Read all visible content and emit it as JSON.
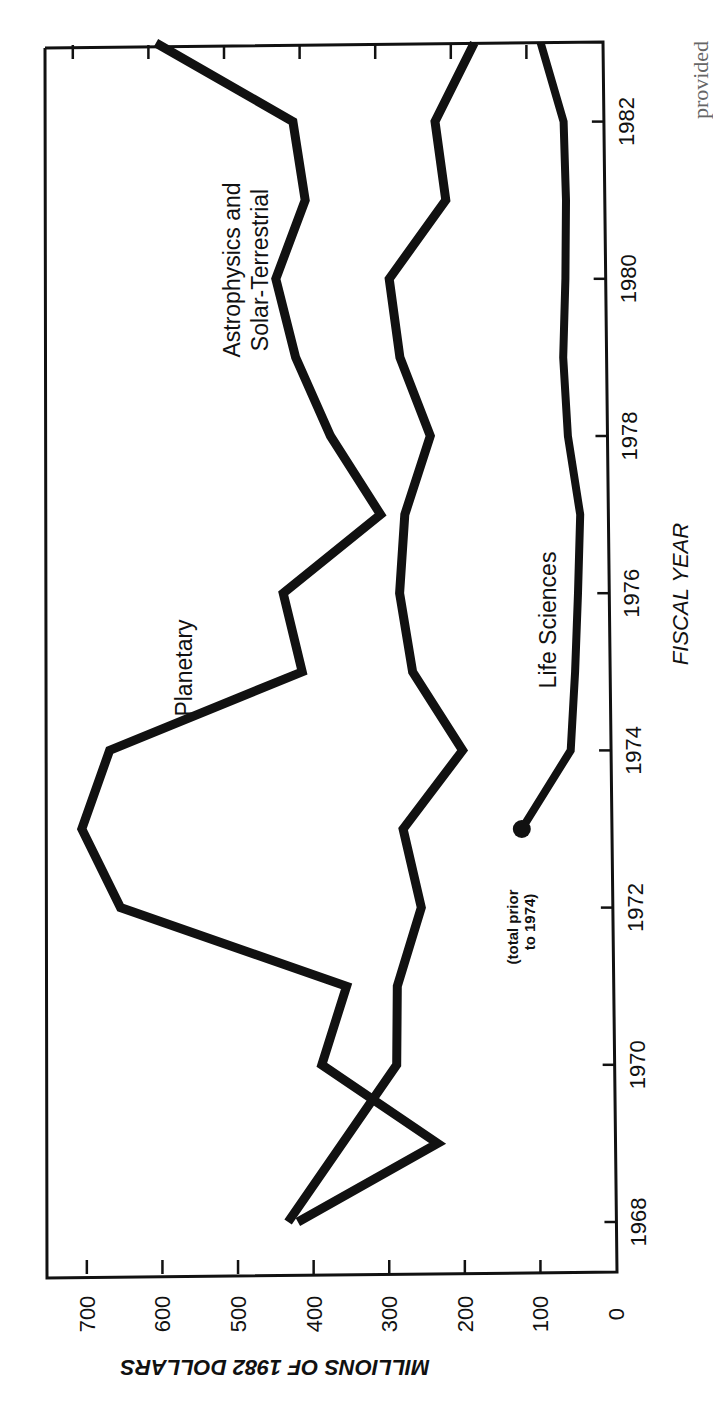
{
  "chart_data": {
    "type": "line",
    "orientation": "rotated 90 degrees counter-clockwise (years run bottom-to-top, values increase right-to-left)",
    "title": "",
    "xlabel": "FISCAL YEAR",
    "ylabel": "MILLIONS OF 1982 DOLLARS",
    "x_ticks": [
      "1968",
      "1970",
      "1972",
      "1974",
      "1976",
      "1978",
      "1980",
      "1982"
    ],
    "y_ticks": [
      "0",
      "100",
      "200",
      "300",
      "400",
      "500",
      "600",
      "700"
    ],
    "xlim": [
      1968,
      1983
    ],
    "ylim": [
      0,
      750
    ],
    "grid": false,
    "legend": "inline labels",
    "series": [
      {
        "name": "Planetary",
        "x": [
          1968,
          1969,
          1970,
          1971,
          1972,
          1973,
          1974,
          1975,
          1976,
          1977,
          1978,
          1979,
          1980,
          1981,
          1982,
          1983
        ],
        "values": [
          420,
          234,
          386,
          352,
          650,
          700,
          662,
          406,
          430,
          300,
          365,
          410,
          435,
          395,
          410,
          590
        ]
      },
      {
        "name": "Astrophysics and Solar-Terrestrial",
        "x": [
          1968,
          1970,
          1971,
          1972,
          1973,
          1974,
          1975,
          1976,
          1977,
          1978,
          1979,
          1980,
          1981,
          1982,
          1983
        ],
        "values": [
          433,
          287,
          285,
          252,
          275,
          195,
          260,
          276,
          268,
          233,
          272,
          285,
          209,
          222,
          169
        ]
      },
      {
        "name": "Life Sciences",
        "x": [
          1973,
          1974,
          1975,
          1976,
          1977,
          1978,
          1979,
          1980,
          1981,
          1982,
          1983
        ],
        "values": [
          118,
          52,
          45,
          40,
          36,
          51,
          56,
          52,
          50,
          52,
          81
        ],
        "annotation": "(total prior to 1974)",
        "annotation_point": {
          "x": 1973,
          "value": 118
        }
      }
    ],
    "labels": {
      "planetary": "Planetary",
      "astro_line1": "Astrophysics and",
      "astro_line2": "Solar-Terrestrial",
      "life": "Life Sciences",
      "note_line1": "(total prior",
      "note_line2": "to 1974)"
    },
    "caption_fragment": "provided"
  }
}
